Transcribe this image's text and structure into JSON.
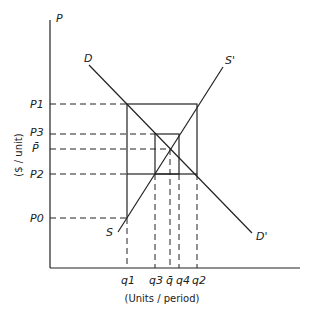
{
  "diagram": {
    "axis_labels": {
      "y_top": "P",
      "y_title": "($ / unit)",
      "x_title": "(Units / period)"
    },
    "curve_labels": {
      "D": "D",
      "D_prime": "D'",
      "S": "S",
      "S_prime": "S'"
    },
    "price_labels": {
      "p1": "P1",
      "p3": "P3",
      "pbar": "P̄",
      "p2": "P2",
      "p0": "P0"
    },
    "quantity_labels": {
      "q1": "q1",
      "q3": "q3",
      "qbar": "q̄",
      "q4": "q4",
      "q2": "q2"
    },
    "colors": {
      "ink": "#222222",
      "background": "#ffffff"
    }
  }
}
